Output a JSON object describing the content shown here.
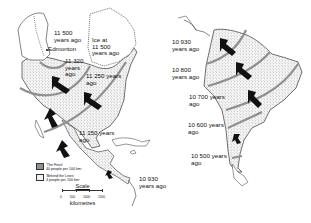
{
  "map": {
    "regions": [
      "North America",
      "South America"
    ],
    "north_america_labels": [
      {
        "id": "edmonton-time",
        "lines": [
          "11 500",
          "years ago"
        ]
      },
      {
        "id": "ice",
        "lines": [
          "Ice at",
          "11 500",
          "years ago"
        ]
      },
      {
        "id": "edmonton",
        "lines": [
          "Edmonton"
        ]
      },
      {
        "id": "front-11320",
        "lines": [
          "11 320",
          "years",
          "ago"
        ]
      },
      {
        "id": "front-11250",
        "lines": [
          "11 250 years",
          "ago"
        ]
      },
      {
        "id": "front-11150",
        "lines": [
          "11 150 years",
          "ago"
        ]
      },
      {
        "id": "front-10930-panama",
        "lines": [
          "10 930",
          "years ago"
        ]
      }
    ],
    "south_america_labels": [
      {
        "id": "front-10930",
        "lines": [
          "10 930",
          "years ago"
        ]
      },
      {
        "id": "front-10800",
        "lines": [
          "10 800",
          "years ago"
        ]
      },
      {
        "id": "front-10700",
        "lines": [
          "10 700 years",
          "ago"
        ]
      },
      {
        "id": "front-10600",
        "lines": [
          "10 600 years",
          "ago"
        ]
      },
      {
        "id": "front-10500",
        "lines": [
          "10 500 years",
          "ago"
        ]
      }
    ],
    "legend": {
      "items": [
        {
          "label": "'The Front'",
          "sublabel": "40 people per 100 km²",
          "color": "#8f8f8f"
        },
        {
          "label": "'Behind the Lines'",
          "sublabel": "4 people per 100 km²",
          "color": "#f1f1f1"
        }
      ]
    },
    "scale": {
      "title": "Scale",
      "ticks": [
        "0",
        "500",
        "1000",
        "1500"
      ],
      "unit": "kilometres"
    },
    "colors": {
      "front_band": "#8f8f8f",
      "stipple_fill": "#e6e6e6",
      "arrow": "#111111",
      "outline": "#333333"
    }
  }
}
